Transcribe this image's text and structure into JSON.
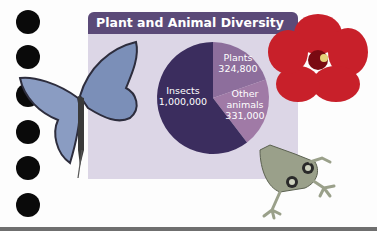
{
  "chart_data": {
    "type": "pie",
    "title": "Plant and Animal Diversity",
    "slices": [
      {
        "label": "Plants",
        "value": 324800,
        "value_label": "324,800",
        "color": "#8d6e9c"
      },
      {
        "label": "Other animals",
        "value": 331000,
        "value_label": "331,000",
        "color": "#a07aa6",
        "label_lines": [
          "Other",
          "animals"
        ]
      },
      {
        "label": "Insects",
        "value": 1000000,
        "value_label": "1,000,000",
        "color": "#3b2d5e"
      }
    ],
    "legend": "none"
  },
  "colors": {
    "header": "#5b4a78",
    "panel": "#dcd6e6",
    "hibiscus": "#c8202a",
    "butterfly": "#7b8fb8",
    "frog": "#9aa08a"
  },
  "decorations": [
    "butterfly-image",
    "hibiscus-image",
    "frog-image",
    "binder-holes"
  ]
}
